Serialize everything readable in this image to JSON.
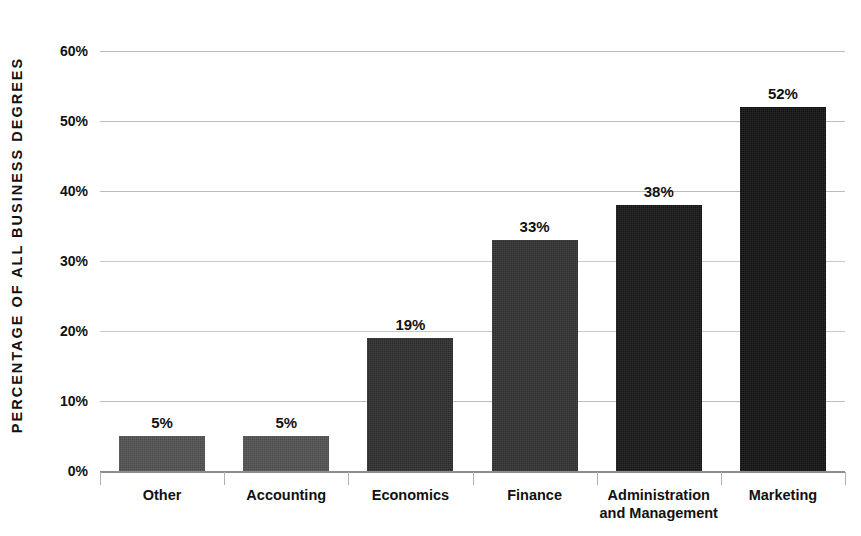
{
  "chart_data": {
    "type": "bar",
    "title": "",
    "xlabel": "",
    "ylabel": "PERCENTAGE OF ALL BUSINESS DEGREES",
    "categories": [
      "Other",
      "Accounting",
      "Economics",
      "Finance",
      "Administration and Management",
      "Marketing"
    ],
    "values": [
      5,
      19,
      33,
      38,
      52,
      52
    ],
    "series": [
      {
        "name": "Percentage of all business degrees",
        "values": [
          5,
          5,
          19,
          33,
          38,
          52
        ]
      }
    ],
    "value_labels": [
      "5%",
      "5%",
      "19%",
      "33%",
      "38%",
      "52%"
    ],
    "ylim": [
      0,
      60
    ],
    "ytick_values": [
      0,
      10,
      20,
      30,
      40,
      50,
      60
    ],
    "ytick_labels": [
      "0%",
      "10%",
      "20%",
      "30%",
      "40%",
      "50%",
      "60%"
    ],
    "grid": true,
    "grid_axis": "y",
    "legend": false,
    "legend_position": "none",
    "bar_colors": [
      "#4d4d4d",
      "#4d4d4d",
      "#2b2b2b",
      "#2f2f2f",
      "#151515",
      "#111111"
    ],
    "grid_color": "#bdbdbd",
    "axis_color": "#8d8d8d",
    "text_color": "#111111",
    "background": "#ffffff"
  },
  "axis": {
    "y_title": "PERCENTAGE OF ALL BUSINESS DEGREES"
  },
  "bars": [
    {
      "category": "Other",
      "label_line1": "Other",
      "label_line2": "",
      "value": 5,
      "value_label": "5%",
      "color": "#4d4d4d"
    },
    {
      "category": "Accounting",
      "label_line1": "Accounting",
      "label_line2": "",
      "value": 5,
      "value_label": "5%",
      "color": "#4d4d4d"
    },
    {
      "category": "Economics",
      "label_line1": "Economics",
      "label_line2": "",
      "value": 19,
      "value_label": "19%",
      "color": "#2b2b2b"
    },
    {
      "category": "Finance",
      "label_line1": "Finance",
      "label_line2": "",
      "value": 33,
      "value_label": "33%",
      "color": "#2f2f2f"
    },
    {
      "category": "Administration and Management",
      "label_line1": "Administration",
      "label_line2": "and Management",
      "value": 38,
      "value_label": "38%",
      "color": "#151515"
    },
    {
      "category": "Marketing",
      "label_line1": "Marketing",
      "label_line2": "",
      "value": 52,
      "value_label": "52%",
      "color": "#111111"
    }
  ],
  "yticks": [
    {
      "label": "60%",
      "value": 60
    },
    {
      "label": "50%",
      "value": 50
    },
    {
      "label": "40%",
      "value": 40
    },
    {
      "label": "30%",
      "value": 30
    },
    {
      "label": "20%",
      "value": 20
    },
    {
      "label": "10%",
      "value": 10
    },
    {
      "label": "0%",
      "value": 0
    }
  ]
}
